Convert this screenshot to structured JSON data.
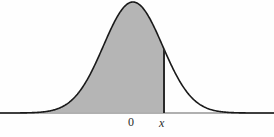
{
  "figure": {
    "name": "normal-distribution-shaded-area",
    "width": 274,
    "height": 137,
    "background_color": "#fefefe"
  },
  "labels": {
    "zero": "0",
    "x": "x"
  },
  "style": {
    "curve_color": "#1a1a1a",
    "curve_width": 1.6,
    "fill_color": "#b5b5b5",
    "axis_color": "#b0b0b0",
    "axis_width": 2,
    "marker_color": "#2a2a2a",
    "marker_width": 2,
    "label_color": "#2a2a2a"
  },
  "chart_data": {
    "type": "area",
    "title": "",
    "subtitle": "",
    "xlabel": "",
    "ylabel": "",
    "grid": false,
    "legend": null,
    "distribution": {
      "name": "normal",
      "mean": 0,
      "std_dev": 1,
      "peak_value": 0.3989
    },
    "axis": {
      "x_axis_y_pixel": 113,
      "x_axis_spans_full_width": true,
      "xlim": [
        -4.4,
        4.4
      ],
      "ylim": [
        0,
        0.42
      ],
      "ticks": [
        {
          "label": "0",
          "value": 0,
          "pixel_x": 133
        },
        {
          "label": "x",
          "value": 1.05,
          "pixel_x": 164
        }
      ]
    },
    "shaded_region": {
      "from": "-infinity",
      "to": "x",
      "to_value": 1.05,
      "fill": "#b5b5b5"
    },
    "markers": [
      {
        "name": "vertical-line-at-x",
        "x_value": 1.05,
        "pixel_x": 164,
        "from_y_pixel": 60,
        "to_y_pixel": 113
      }
    ],
    "x": [
      -4.4,
      -4.1,
      -3.8,
      -3.5,
      -3.2,
      -2.9,
      -2.6,
      -2.3,
      -2.0,
      -1.7,
      -1.4,
      -1.1,
      -0.8,
      -0.5,
      -0.2,
      0.0,
      0.2,
      0.5,
      0.8,
      1.05,
      1.1,
      1.4,
      1.7,
      2.0,
      2.3,
      2.6,
      2.9,
      3.2,
      3.5,
      3.8,
      4.1,
      4.4
    ],
    "y": [
      0.0001,
      0.0001,
      0.0003,
      0.0009,
      0.0024,
      0.006,
      0.0136,
      0.0283,
      0.054,
      0.094,
      0.1497,
      0.2179,
      0.2897,
      0.3521,
      0.391,
      0.3989,
      0.391,
      0.3521,
      0.2897,
      0.2299,
      0.2179,
      0.1497,
      0.094,
      0.054,
      0.0283,
      0.0136,
      0.006,
      0.0024,
      0.0009,
      0.0003,
      0.0001,
      0.0001
    ]
  }
}
